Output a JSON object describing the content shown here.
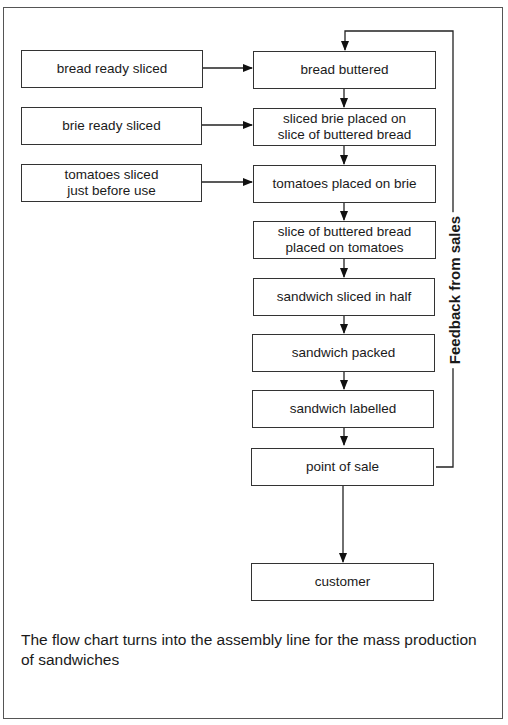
{
  "diagram": {
    "type": "flowchart",
    "inputs": [
      {
        "id": "in1",
        "label": "bread ready sliced",
        "feeds": "s1"
      },
      {
        "id": "in2",
        "label": "brie ready sliced",
        "feeds": "s2"
      },
      {
        "id": "in3",
        "label": "tomatoes sliced\njust before use",
        "feeds": "s3"
      }
    ],
    "steps": [
      {
        "id": "s1",
        "label": "bread buttered"
      },
      {
        "id": "s2",
        "label": "sliced brie placed on\nslice of buttered bread"
      },
      {
        "id": "s3",
        "label": "tomatoes placed on brie"
      },
      {
        "id": "s4",
        "label": "slice of buttered bread\nplaced on tomatoes"
      },
      {
        "id": "s5",
        "label": "sandwich sliced in half"
      },
      {
        "id": "s6",
        "label": "sandwich packed"
      },
      {
        "id": "s7",
        "label": "sandwich labelled"
      },
      {
        "id": "s8",
        "label": "point of sale"
      },
      {
        "id": "s9",
        "label": "customer"
      }
    ],
    "feedback": {
      "label": "Feedback from sales",
      "from": "s8",
      "to": "s1"
    },
    "caption": "The flow chart turns into the assembly line for the mass production of sandwiches"
  }
}
